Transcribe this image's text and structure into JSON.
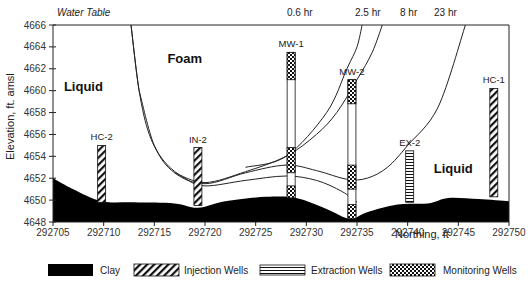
{
  "chart_data": {
    "type": "diagram-cross-section",
    "title": "",
    "xlabel": "Northing, ft",
    "ylabel": "Elevation, ft. amsl",
    "xlim": [
      292705,
      292750
    ],
    "ylim": [
      4648,
      4666
    ],
    "x_ticks": [
      "292705",
      "292710",
      "292715",
      "292720",
      "292725",
      "292730",
      "292735",
      "292740",
      "292745",
      "292750"
    ],
    "y_ticks": [
      "4666",
      "4664",
      "4662",
      "4660",
      "4658",
      "4656",
      "4654",
      "4652",
      "4650",
      "4648"
    ],
    "grid": false,
    "top_label": "Water Table",
    "regions": [
      {
        "label": "Liquid",
        "x": 292708,
        "y": 4660
      },
      {
        "label": "Foam",
        "x": 292718,
        "y": 4662.5
      },
      {
        "label": "Liquid",
        "x": 292744.5,
        "y": 4652.5
      }
    ],
    "front_curves": [
      {
        "label": "0.6 hr",
        "points": [
          [
            292712.7,
            4666
          ],
          [
            292713.5,
            4660
          ],
          [
            292714.5,
            4656
          ],
          [
            292716,
            4653.5
          ],
          [
            292718,
            4652
          ],
          [
            292720,
            4651.3
          ],
          [
            292724,
            4651.8
          ],
          [
            292728,
            4652.2
          ],
          [
            292731,
            4651.8
          ],
          [
            292733.5,
            4650.8
          ],
          [
            292735,
            4649.8
          ]
        ]
      },
      {
        "label": "2.5 hr",
        "points": [
          [
            292713.5,
            4660
          ],
          [
            292715,
            4655
          ],
          [
            292717,
            4652.5
          ],
          [
            292720,
            4651.5
          ],
          [
            292724,
            4652.5
          ],
          [
            292728,
            4653.2
          ],
          [
            292731,
            4652.7
          ],
          [
            292734,
            4651.9
          ],
          [
            292736,
            4652
          ],
          [
            292738,
            4653
          ],
          [
            292740,
            4655
          ],
          [
            292743,
            4658.5
          ],
          [
            292745.7,
            4666
          ]
        ]
      },
      {
        "label": "8 hr",
        "points": [
          [
            292717,
            4652.5
          ],
          [
            292720,
            4651.6
          ],
          [
            292724,
            4652.6
          ],
          [
            292728,
            4654
          ],
          [
            292731,
            4656
          ],
          [
            292733,
            4658
          ],
          [
            292735,
            4661
          ],
          [
            292736.5,
            4663.5
          ],
          [
            292737.5,
            4666
          ]
        ]
      },
      {
        "label": "23 hr",
        "points": [
          [
            292724,
            4653
          ],
          [
            292728,
            4654
          ],
          [
            292732,
            4658
          ],
          [
            292734,
            4662
          ],
          [
            292735,
            4664
          ],
          [
            292735.5,
            4666
          ]
        ]
      }
    ],
    "wells": [
      {
        "name": "HC-2",
        "type": "Injection",
        "x": 292709.8,
        "top": 4655,
        "bottom": 4649.8
      },
      {
        "name": "IN-2",
        "type": "Injection",
        "x": 292719.3,
        "top": 4654.8,
        "bottom": 4649.5
      },
      {
        "name": "MW-1",
        "type": "Monitoring",
        "x": 292728.5,
        "top": 4663.5,
        "bottom": 4650.2,
        "screens": [
          [
            4661,
            4663.5
          ],
          [
            4652.5,
            4654.8
          ],
          [
            4650.2,
            4651.3
          ]
        ]
      },
      {
        "name": "MW-2",
        "type": "Monitoring",
        "x": 292734.5,
        "top": 4661,
        "bottom": 4648.3,
        "screens": [
          [
            4658.8,
            4661
          ],
          [
            4651,
            4653.2
          ],
          [
            4648.3,
            4649.6
          ]
        ]
      },
      {
        "name": "EX-2",
        "type": "Extraction",
        "x": 292740.2,
        "top": 4654.5,
        "bottom": 4649.8
      },
      {
        "name": "HC-1",
        "type": "Injection",
        "x": 292748.5,
        "top": 4660.2,
        "bottom": 4650.3
      }
    ],
    "clay_surface": [
      [
        292705,
        4652
      ],
      [
        292707,
        4651
      ],
      [
        292709.8,
        4649.9
      ],
      [
        292713,
        4649.8
      ],
      [
        292717,
        4649.7
      ],
      [
        292719.3,
        4649.3
      ],
      [
        292722,
        4649.9
      ],
      [
        292726,
        4650.3
      ],
      [
        292729,
        4650.2
      ],
      [
        292732,
        4649.2
      ],
      [
        292734.3,
        4648.3
      ],
      [
        292736,
        4648.9
      ],
      [
        292739,
        4649.6
      ],
      [
        292742,
        4649.7
      ],
      [
        292744,
        4650.2
      ],
      [
        292747,
        4650.1
      ],
      [
        292750,
        4649.9
      ]
    ],
    "legend": [
      "Clay",
      "Injection Wells",
      "Extraction Wells",
      "Monitoring Wells"
    ],
    "legend_position": "bottom"
  },
  "legend": {
    "clay": "Clay",
    "injection": "Injection Wells",
    "extraction": "Extraction Wells",
    "monitoring": "Monitoring Wells"
  },
  "axes": {
    "xlabel": "Northing, ft",
    "ylabel": "Elevation, ft. amsl",
    "top_label": "Water Table"
  }
}
